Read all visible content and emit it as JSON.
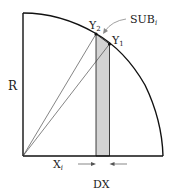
{
  "diagram": {
    "labels": {
      "radius": "R",
      "y2": "Y",
      "y2_sub": "2",
      "y1": "Y",
      "y1_sub": "1",
      "sub": "SUB",
      "sub_sub": "i",
      "xi": "X",
      "xi_sub": "i",
      "dx": "DX"
    },
    "colors": {
      "stroke": "#111111",
      "strip_fill": "#d4d4d4"
    }
  }
}
